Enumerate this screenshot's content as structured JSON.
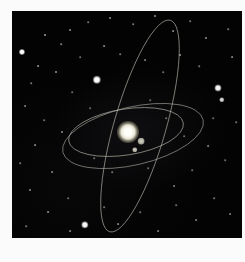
{
  "scene": {
    "title": "Orbital diagram of a multi-planet star system over a starfield",
    "field_label": "night-sky starfield",
    "background_color": "#030303",
    "page_margin_color": "#fbfbfb",
    "field": {
      "x": 12,
      "y": 11,
      "width": 230,
      "height": 227
    }
  },
  "primary": {
    "label": "central star",
    "x": 128,
    "y": 132,
    "radius": 11,
    "color": "#ffffff"
  },
  "orbits": [
    {
      "label": "inner orbit",
      "cx": 126,
      "cy": 132,
      "rx": 58,
      "ry": 23,
      "rotation": -9,
      "color": "#b9b9ae",
      "opacity": 0.78,
      "width": 0.8
    },
    {
      "label": "middle orbit",
      "cx": 133,
      "cy": 136,
      "rx": 72,
      "ry": 29,
      "rotation": -13,
      "color": "#b4b4a9",
      "opacity": 0.7,
      "width": 0.8
    },
    {
      "label": "outer inclined orbit",
      "cx": 140,
      "cy": 126,
      "rx": 26,
      "ry": 110,
      "rotation": 16,
      "color": "#c2c2b6",
      "opacity": 0.72,
      "width": 0.8
    }
  ],
  "bodies": [
    {
      "label": "planet-inner",
      "x": 141,
      "y": 141,
      "radius": 2.6,
      "color": "#cfcdbe"
    },
    {
      "label": "planet-middle",
      "x": 135,
      "y": 150,
      "radius": 2.1,
      "color": "#c3c1b3"
    }
  ],
  "stars": [
    {
      "x": 22,
      "y": 52,
      "r": 1.9,
      "a": 0.98
    },
    {
      "x": 97,
      "y": 80,
      "r": 2.6,
      "a": 1.0
    },
    {
      "x": 218,
      "y": 88,
      "r": 2.2,
      "a": 0.95
    },
    {
      "x": 222,
      "y": 100,
      "r": 1.7,
      "a": 0.82
    },
    {
      "x": 85,
      "y": 225,
      "r": 2.3,
      "a": 0.97
    },
    {
      "x": 45,
      "y": 35,
      "r": 1.0,
      "a": 0.62
    },
    {
      "x": 61,
      "y": 44,
      "r": 0.8,
      "a": 0.5
    },
    {
      "x": 38,
      "y": 66,
      "r": 0.9,
      "a": 0.55
    },
    {
      "x": 56,
      "y": 72,
      "r": 1.0,
      "a": 0.6
    },
    {
      "x": 31,
      "y": 83,
      "r": 0.8,
      "a": 0.45
    },
    {
      "x": 70,
      "y": 30,
      "r": 0.9,
      "a": 0.5
    },
    {
      "x": 88,
      "y": 22,
      "r": 0.8,
      "a": 0.44
    },
    {
      "x": 110,
      "y": 18,
      "r": 0.9,
      "a": 0.5
    },
    {
      "x": 133,
      "y": 24,
      "r": 0.8,
      "a": 0.46
    },
    {
      "x": 155,
      "y": 16,
      "r": 1.0,
      "a": 0.55
    },
    {
      "x": 173,
      "y": 31,
      "r": 0.9,
      "a": 0.5
    },
    {
      "x": 190,
      "y": 21,
      "r": 0.8,
      "a": 0.44
    },
    {
      "x": 206,
      "y": 38,
      "r": 1.0,
      "a": 0.58
    },
    {
      "x": 228,
      "y": 29,
      "r": 0.8,
      "a": 0.46
    },
    {
      "x": 232,
      "y": 57,
      "r": 0.9,
      "a": 0.5
    },
    {
      "x": 199,
      "y": 66,
      "r": 0.8,
      "a": 0.44
    },
    {
      "x": 180,
      "y": 55,
      "r": 0.9,
      "a": 0.5
    },
    {
      "x": 163,
      "y": 72,
      "r": 0.8,
      "a": 0.42
    },
    {
      "x": 145,
      "y": 60,
      "r": 0.9,
      "a": 0.48
    },
    {
      "x": 120,
      "y": 54,
      "r": 0.8,
      "a": 0.44
    },
    {
      "x": 104,
      "y": 46,
      "r": 0.9,
      "a": 0.5
    },
    {
      "x": 80,
      "y": 57,
      "r": 0.8,
      "a": 0.42
    },
    {
      "x": 25,
      "y": 106,
      "r": 0.9,
      "a": 0.48
    },
    {
      "x": 44,
      "y": 120,
      "r": 0.8,
      "a": 0.42
    },
    {
      "x": 62,
      "y": 132,
      "r": 1.0,
      "a": 0.55
    },
    {
      "x": 35,
      "y": 145,
      "r": 0.9,
      "a": 0.5
    },
    {
      "x": 20,
      "y": 163,
      "r": 0.8,
      "a": 0.44
    },
    {
      "x": 52,
      "y": 172,
      "r": 0.9,
      "a": 0.48
    },
    {
      "x": 30,
      "y": 190,
      "r": 1.0,
      "a": 0.54
    },
    {
      "x": 68,
      "y": 198,
      "r": 0.8,
      "a": 0.42
    },
    {
      "x": 48,
      "y": 212,
      "r": 0.9,
      "a": 0.5
    },
    {
      "x": 26,
      "y": 226,
      "r": 0.8,
      "a": 0.44
    },
    {
      "x": 70,
      "y": 231,
      "r": 0.9,
      "a": 0.48
    },
    {
      "x": 104,
      "y": 207,
      "r": 0.8,
      "a": 0.42
    },
    {
      "x": 118,
      "y": 224,
      "r": 0.9,
      "a": 0.5
    },
    {
      "x": 140,
      "y": 212,
      "r": 0.8,
      "a": 0.42
    },
    {
      "x": 158,
      "y": 231,
      "r": 0.9,
      "a": 0.46
    },
    {
      "x": 176,
      "y": 205,
      "r": 0.8,
      "a": 0.42
    },
    {
      "x": 196,
      "y": 220,
      "r": 0.9,
      "a": 0.48
    },
    {
      "x": 214,
      "y": 198,
      "r": 0.8,
      "a": 0.44
    },
    {
      "x": 230,
      "y": 214,
      "r": 0.9,
      "a": 0.46
    },
    {
      "x": 225,
      "y": 160,
      "r": 0.8,
      "a": 0.42
    },
    {
      "x": 208,
      "y": 146,
      "r": 0.9,
      "a": 0.48
    },
    {
      "x": 192,
      "y": 170,
      "r": 0.8,
      "a": 0.42
    },
    {
      "x": 174,
      "y": 186,
      "r": 0.9,
      "a": 0.46
    },
    {
      "x": 236,
      "y": 122,
      "r": 0.8,
      "a": 0.44
    },
    {
      "x": 213,
      "y": 118,
      "r": 0.8,
      "a": 0.4
    },
    {
      "x": 90,
      "y": 108,
      "r": 0.8,
      "a": 0.4
    },
    {
      "x": 72,
      "y": 92,
      "r": 0.8,
      "a": 0.42
    },
    {
      "x": 150,
      "y": 100,
      "r": 0.8,
      "a": 0.4
    },
    {
      "x": 166,
      "y": 118,
      "r": 0.8,
      "a": 0.4
    },
    {
      "x": 112,
      "y": 172,
      "r": 0.8,
      "a": 0.42
    },
    {
      "x": 94,
      "y": 158,
      "r": 0.8,
      "a": 0.4
    },
    {
      "x": 148,
      "y": 168,
      "r": 0.8,
      "a": 0.4
    },
    {
      "x": 184,
      "y": 136,
      "r": 0.8,
      "a": 0.4
    }
  ]
}
